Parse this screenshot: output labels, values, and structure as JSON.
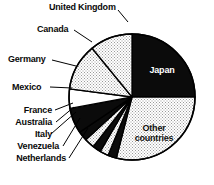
{
  "chart_data": {
    "type": "pie",
    "title": "",
    "subtitle": "",
    "xlabel": "",
    "ylabel": "",
    "legend_position": "callout-labels",
    "grid": false,
    "start_angle_deg": 0,
    "direction": "clockwise",
    "center": {
      "x": 132,
      "y": 97,
      "r": 63
    },
    "categories": [
      "Japan",
      "Other countries",
      "Netherlands",
      "Venezuela",
      "Italy",
      "Australia",
      "France",
      "Mexico",
      "Germany",
      "Canada",
      "United Kingdom"
    ],
    "values": [
      25.0,
      29.0,
      2.2,
      2.2,
      2.2,
      2.5,
      2.5,
      6.5,
      5.0,
      12.0,
      10.9
    ],
    "slices": [
      {
        "label": "Japan",
        "value": 25.0,
        "fill": "solid-black",
        "start_deg": 0.0,
        "end_deg": 90.0
      },
      {
        "label": "Other countries",
        "value": 29.0,
        "fill": "light-dotted",
        "start_deg": 90.0,
        "end_deg": 194.4
      },
      {
        "label": "Netherlands",
        "value": 2.2,
        "fill": "solid-black",
        "start_deg": 194.4,
        "end_deg": 202.3
      },
      {
        "label": "Venezuela",
        "value": 2.2,
        "fill": "light-dotted",
        "start_deg": 202.3,
        "end_deg": 210.2
      },
      {
        "label": "Italy",
        "value": 2.2,
        "fill": "solid-black",
        "start_deg": 210.2,
        "end_deg": 218.1
      },
      {
        "label": "Australia",
        "value": 2.5,
        "fill": "light-dotted",
        "start_deg": 218.1,
        "end_deg": 227.1
      },
      {
        "label": "France",
        "value": 2.5,
        "fill": "solid-black",
        "start_deg": 227.1,
        "end_deg": 236.1
      },
      {
        "label": "Mexico",
        "value": 6.5,
        "fill": "solid-black",
        "start_deg": 236.1,
        "end_deg": 259.5
      },
      {
        "label": "Germany",
        "value": 5.0,
        "fill": "white",
        "start_deg": 259.5,
        "end_deg": 277.5
      },
      {
        "label": "Canada",
        "value": 12.0,
        "fill": "light-dotted",
        "start_deg": 277.5,
        "end_deg": 320.7
      },
      {
        "label": "United Kingdom",
        "value": 10.9,
        "fill": "light-dotted",
        "start_deg": 320.7,
        "end_deg": 360.0
      }
    ]
  },
  "labels": {
    "united_kingdom": "United Kingdom",
    "canada": "Canada",
    "germany": "Germany",
    "mexico": "Mexico",
    "france": "France",
    "australia": "Australia",
    "italy": "Italy",
    "venezuela": "Venezuela",
    "netherlands": "Netherlands",
    "japan": "Japan",
    "other_countries_line1": "Other",
    "other_countries_line2": "countries"
  },
  "colors": {
    "outline": "#000000",
    "dark_slice": "#0b0b0b",
    "light_slice": "#dcdcdc",
    "white_slice": "#ffffff",
    "label_text": "#0a0a0a",
    "label_text_on_dark": "#ffffff",
    "background": "#ffffff"
  }
}
